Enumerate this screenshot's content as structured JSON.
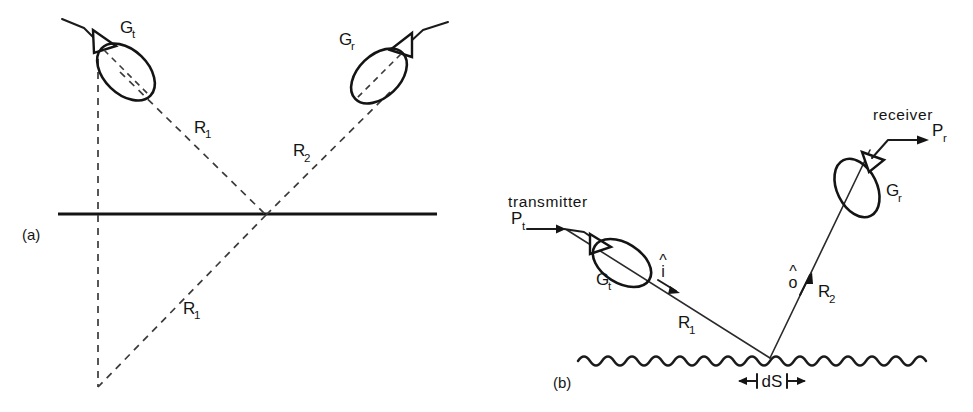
{
  "figure": {
    "background_color": "#ffffff",
    "ink_color": "#141414"
  },
  "panel_a": {
    "caption": "(a)",
    "transmitter_gain_label": "G",
    "transmitter_gain_sub": "t",
    "receiver_gain_label": "G",
    "receiver_gain_sub": "r",
    "path_incident_label": "R",
    "path_incident_sub": "1",
    "path_scattered_label": "R",
    "path_scattered_sub": "2",
    "path_image_label": "R",
    "path_image_sub": "1"
  },
  "panel_b": {
    "caption": "(b)",
    "transmitter_word": "transmitter",
    "receiver_word": "receiver",
    "power_transmitted_label": "P",
    "power_transmitted_sub": "t",
    "power_received_label": "P",
    "power_received_sub": "r",
    "transmitter_gain_label": "G",
    "transmitter_gain_sub": "t",
    "receiver_gain_label": "G",
    "receiver_gain_sub": "r",
    "incident_unit_vector": "i",
    "scattered_unit_vector": "o",
    "hat_glyph": "^",
    "path_incident_label": "R",
    "path_incident_sub": "1",
    "path_scattered_label": "R",
    "path_scattered_sub": "2",
    "surface_element_label": "dS"
  }
}
